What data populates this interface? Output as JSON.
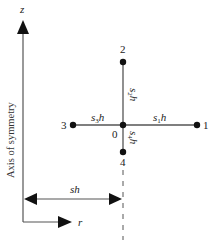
{
  "diagram": {
    "axes": {
      "z_label": "z",
      "r_label": "r",
      "symmetry_label": "Axis of symmetry"
    },
    "nodes": [
      {
        "id": "0",
        "label": "0",
        "x": 123,
        "y": 125
      },
      {
        "id": "1",
        "label": "1",
        "x": 197,
        "y": 125
      },
      {
        "id": "2",
        "label": "2",
        "x": 123,
        "y": 62
      },
      {
        "id": "3",
        "label": "3",
        "x": 73,
        "y": 125
      },
      {
        "id": "4",
        "label": "4",
        "x": 123,
        "y": 152
      }
    ],
    "edges": [
      {
        "from": "0",
        "to": "1",
        "label_s": "s",
        "label_sub": "1",
        "label_h": "h"
      },
      {
        "from": "0",
        "to": "2",
        "label_s": "s",
        "label_sub": "2",
        "label_h": "h"
      },
      {
        "from": "0",
        "to": "3",
        "label_s": "s",
        "label_sub": "3",
        "label_h": "h"
      },
      {
        "from": "0",
        "to": "4",
        "label_s": "s",
        "label_sub": "4",
        "label_h": "h"
      }
    ],
    "dimension": {
      "label": "sh"
    },
    "colors": {
      "line": "#555555",
      "node": "#111111",
      "text": "#222222"
    }
  }
}
